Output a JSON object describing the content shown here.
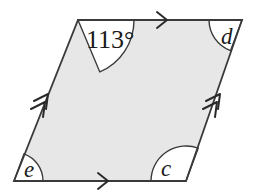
{
  "figure": {
    "type": "parallelogram-angle-diagram",
    "fill_color": "#e7e7e7",
    "stroke_color": "#3a3a3a",
    "arc_fill_color": "#ffffff",
    "background_color": "#ffffff",
    "vertices": {
      "top_left": [
        78,
        20
      ],
      "top_right": [
        242,
        20
      ],
      "bottom_right": [
        186,
        181
      ],
      "bottom_left": [
        14,
        181
      ]
    },
    "angles": [
      {
        "id": "angle-top-left",
        "label": "113°",
        "vertex": "top_left",
        "arc_radius": 56,
        "text_x": 86,
        "text_y": 48
      },
      {
        "id": "angle-top-right",
        "label": "d",
        "vertex": "top_right",
        "arc_radius": 33,
        "text_x": 221,
        "text_y": 44
      },
      {
        "id": "angle-bottom-right",
        "label": "c",
        "vertex": "bottom_right",
        "arc_radius": 35,
        "text_x": 161,
        "text_y": 176
      },
      {
        "id": "angle-bottom-left",
        "label": "e",
        "vertex": "bottom_left",
        "arc_radius": 29,
        "text_x": 24,
        "text_y": 177
      }
    ],
    "tick_marks": [
      {
        "id": "tick-top-edge",
        "edge": "top",
        "count": 1,
        "direction": "right",
        "x": 163,
        "y": 20
      },
      {
        "id": "tick-bottom-edge",
        "edge": "bottom",
        "count": 1,
        "direction": "right",
        "x": 104,
        "y": 181
      },
      {
        "id": "tick-left-edge",
        "edge": "left",
        "count": 2,
        "direction": "up-right",
        "x": 46,
        "y": 101
      },
      {
        "id": "tick-right-edge",
        "edge": "right",
        "count": 2,
        "direction": "up-right",
        "x": 214,
        "y": 101
      }
    ]
  }
}
